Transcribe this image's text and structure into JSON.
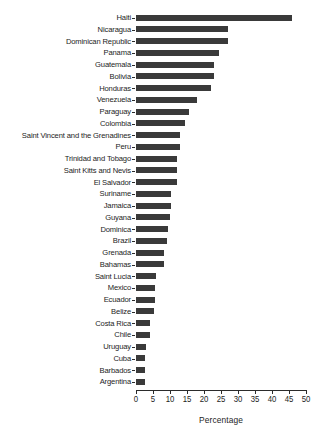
{
  "chart_data": {
    "type": "bar",
    "orientation": "horizontal",
    "title": "",
    "xlabel": "Percentage",
    "ylabel": "",
    "xlim": [
      0,
      50
    ],
    "xticks": [
      0,
      5,
      10,
      15,
      20,
      25,
      30,
      35,
      40,
      45,
      50
    ],
    "grid": false,
    "legend": null,
    "bar_color": "#3a3a3a",
    "categories": [
      "Haiti",
      "Nicaragua",
      "Dominican Republic",
      "Panama",
      "Guatemala",
      "Bolivia",
      "Honduras",
      "Venezuela",
      "Paraguay",
      "Colombia",
      "Saint Vincent and the Grenadines",
      "Peru",
      "Trinidad and Tobago",
      "Saint Kitts and Nevis",
      "El Salvador",
      "Suriname",
      "Jamaica",
      "Guyana",
      "Dominica",
      "Brazil",
      "Grenada",
      "Bahamas",
      "Saint Lucia",
      "Mexico",
      "Ecuador",
      "Belize",
      "Costa Rica",
      "Chile",
      "Uruguay",
      "Cuba",
      "Barbados",
      "Argentina"
    ],
    "values": [
      45.9,
      27.0,
      27.0,
      24.4,
      23.0,
      23.0,
      22.0,
      18.0,
      15.6,
      14.4,
      13.0,
      13.0,
      12.2,
      12.2,
      12.2,
      10.3,
      10.3,
      10.0,
      9.4,
      9.1,
      8.2,
      8.2,
      6.0,
      5.6,
      5.6,
      5.3,
      4.1,
      4.1,
      3.0,
      2.7,
      2.7,
      2.6
    ]
  },
  "axis": {
    "x_title": "Percentage"
  }
}
